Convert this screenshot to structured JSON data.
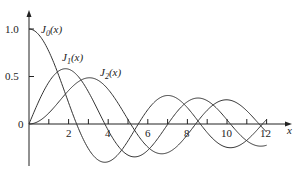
{
  "chart_data": {
    "type": "line",
    "title": "",
    "xlabel": "x",
    "ylabel": "",
    "xlim": [
      0,
      13
    ],
    "ylim": [
      -0.42,
      1.15
    ],
    "x_ticks": [
      1,
      2,
      3,
      4,
      5,
      6,
      7,
      8,
      9,
      10,
      11,
      12
    ],
    "x_tick_labels": [
      "2",
      "4",
      "6",
      "8",
      "10",
      "12"
    ],
    "y_tick_labels": [
      "0",
      "0.5",
      "1.0"
    ],
    "grid": false,
    "legend": "inline labels",
    "series": [
      {
        "name": "J0(x)",
        "label_main": "J",
        "label_sub": "0",
        "label_tail": "(x)",
        "order": 0,
        "x_range": [
          0,
          12
        ]
      },
      {
        "name": "J1(x)",
        "label_main": "J",
        "label_sub": "1",
        "label_tail": "(x)",
        "order": 1,
        "x_range": [
          0,
          12
        ]
      },
      {
        "name": "J2(x)",
        "label_main": "J",
        "label_sub": "2",
        "label_tail": "(x)",
        "order": 2,
        "x_range": [
          0,
          12
        ]
      }
    ]
  },
  "labels": {
    "origin": "0",
    "y05": "0.5",
    "y10": "1.0",
    "x2": "2",
    "x4": "4",
    "x6": "6",
    "x8": "8",
    "x10": "10",
    "x12": "12",
    "xaxis": "x"
  }
}
